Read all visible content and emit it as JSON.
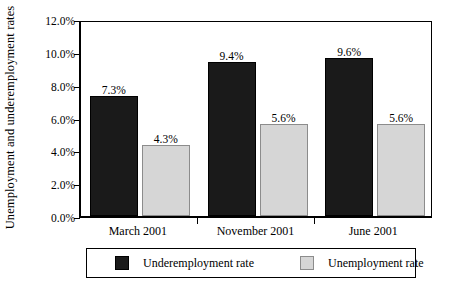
{
  "chart_data": {
    "type": "bar",
    "title": "",
    "subtitle": "",
    "xlabel": "",
    "ylabel": "Unemployment and underemployment rates",
    "categories": [
      "March 2001",
      "November 2001",
      "June 2001"
    ],
    "series": [
      {
        "name": "Underemployment rate",
        "color": "#1a1a1a",
        "values": [
          7.3,
          9.4,
          9.6
        ],
        "labels": [
          "7.3%",
          "9.4%",
          "9.6%"
        ]
      },
      {
        "name": "Unemployment rate",
        "color": "#d6d6d6",
        "values": [
          4.3,
          5.6,
          5.6
        ],
        "labels": [
          "4.3%",
          "5.6%",
          "5.6%"
        ]
      }
    ],
    "ylim": [
      0,
      12
    ],
    "ytick_values": [
      0,
      2,
      4,
      6,
      8,
      10,
      12
    ],
    "ytick_labels": [
      "0.0%",
      "2.0%",
      "4.0%",
      "6.0%",
      "8.0%",
      "10.0%",
      "12.0%"
    ],
    "grid": false,
    "legend_position": "bottom",
    "value_labels_shown": true,
    "unit": "%"
  },
  "axes": {
    "y_title": "Unemployment and underemployment rates"
  },
  "legend": {
    "entries": [
      {
        "label": "Underemployment rate",
        "swatch": "dark"
      },
      {
        "label": "Unemployment rate",
        "swatch": "light"
      }
    ]
  }
}
